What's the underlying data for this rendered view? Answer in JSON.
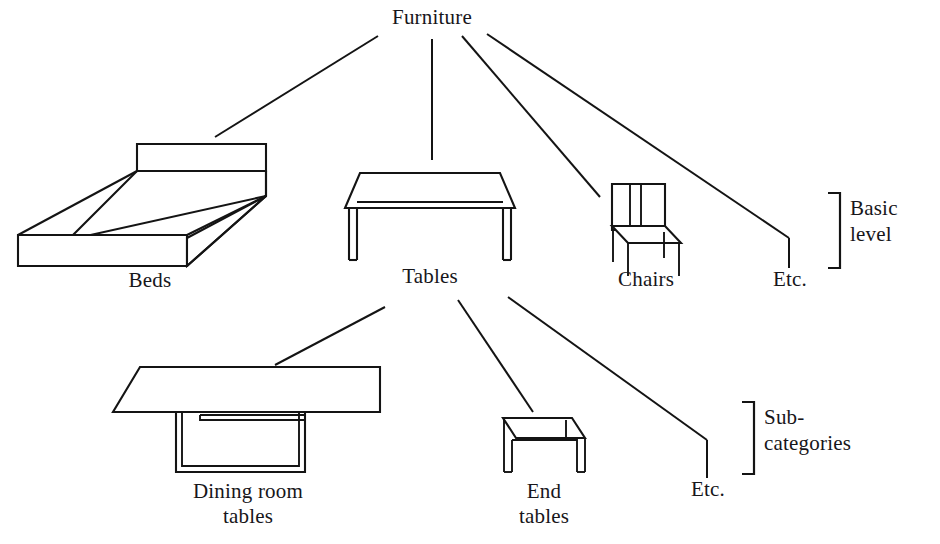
{
  "figure": {
    "type": "hierarchical-taxonomy-diagram",
    "background_color": "#ffffff",
    "ink_color": "#141414"
  },
  "nodes": {
    "root": {
      "label": "Furniture",
      "level": "superordinate"
    },
    "basic": [
      {
        "id": "beds",
        "label": "Beds",
        "icon": "bed-illustration"
      },
      {
        "id": "tables",
        "label": "Tables",
        "icon": "table-illustration"
      },
      {
        "id": "chairs",
        "label": "Chairs",
        "icon": "chair-illustration"
      },
      {
        "id": "etc_basic",
        "label": "Etc.",
        "icon": "none"
      }
    ],
    "subordinate": [
      {
        "id": "dining_room_tables",
        "label": "Dining room tables",
        "line1": "Dining room",
        "line2": "tables",
        "icon": "dining-table-illustration"
      },
      {
        "id": "end_tables",
        "label": "End tables",
        "line1": "End",
        "line2": "tables",
        "icon": "end-table-illustration"
      },
      {
        "id": "etc_sub",
        "label": "Etc.",
        "icon": "none"
      }
    ]
  },
  "brackets": {
    "basic_level": {
      "line1": "Basic",
      "line2": "level"
    },
    "subcategories": {
      "line1": "Sub-",
      "line2": "categories"
    }
  }
}
